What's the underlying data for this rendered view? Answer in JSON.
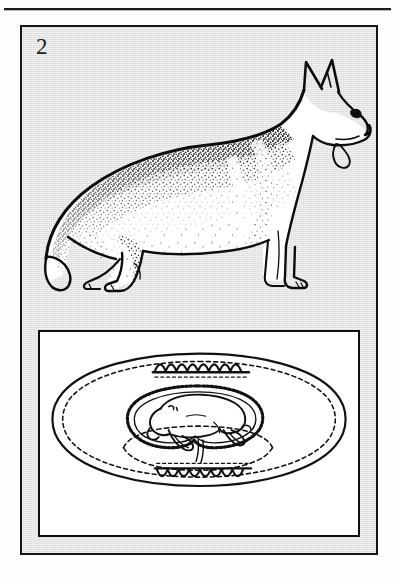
{
  "page": {
    "kind": "scanned-book-figure-page",
    "background_color": "#fefefe",
    "rule_color": "#1a1a1a"
  },
  "figure": {
    "number_label": "2",
    "panel_background_color": "#d9d9d9",
    "panel_border_color": "#161616",
    "ink_color": "#101010",
    "caption": ""
  },
  "illustrations": [
    {
      "name": "german-shepherd-dog",
      "description": "Side profile line drawing of a standing German Shepherd dog facing right, with erect pointed ears, open mouth and protruding tongue, stippled dark saddle marking over the back and shoulders, low-set bushy tail, and angulated hind legs.",
      "orientation": "facing-right",
      "style": "pen-and-ink line drawing with stipple shading"
    },
    {
      "name": "fetus-in-uterus-inset",
      "description": "Inset diagram of a canine fetus curled within its amniotic and chorioallantoic membranes inside an oval uterine segment, with scalloped zonary placental bands at the top and bottom.",
      "orientation": "fetus head to the left",
      "style": "outline diagram with dashed membrane lines"
    }
  ],
  "inset": {
    "background_color": "#ffffff",
    "border_color": "#101010"
  }
}
